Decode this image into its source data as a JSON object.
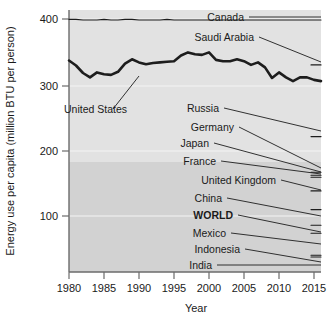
{
  "chart_data": {
    "type": "line",
    "title": "",
    "xlabel": "Year",
    "ylabel": "Energy use per capita (million BTU per person)",
    "xlim": [
      1980,
      2016
    ],
    "ylim": [
      0,
      420
    ],
    "xticks": [
      1980,
      1985,
      1990,
      1995,
      2000,
      2005,
      2010,
      2015
    ],
    "xtick_labels": [
      "1980",
      "1985",
      "1990",
      "1995",
      "2000",
      "2005",
      "2010",
      "2015"
    ],
    "yticks": [
      100,
      200,
      300,
      400
    ],
    "ytick_labels": [
      "100",
      "200",
      "300",
      "400"
    ],
    "grid": true,
    "legend": "inline-labels-right",
    "x": [
      1980,
      1981,
      1982,
      1983,
      1984,
      1985,
      1986,
      1987,
      1988,
      1989,
      1990,
      1991,
      1992,
      1993,
      1994,
      1995,
      1996,
      1997,
      1998,
      1999,
      2000,
      2001,
      2002,
      2003,
      2004,
      2005,
      2006,
      2007,
      2008,
      2009,
      2010,
      2011,
      2012,
      2013,
      2014,
      2015,
      2016
    ],
    "series": [
      {
        "name": "Canada",
        "label": "Canada",
        "bold": false,
        "values": [
          405,
          405,
          404,
          404,
          404,
          405,
          404,
          404,
          405,
          405,
          404,
          404,
          404,
          404,
          405,
          404,
          404,
          404,
          404,
          404,
          404,
          404,
          404,
          404,
          404,
          404,
          404,
          404,
          404,
          404,
          404,
          404,
          404,
          404,
          404,
          404,
          404
        ],
        "end_value": 404
      },
      {
        "name": "Saudi Arabia",
        "label": "Saudi Arabia",
        "bold": false,
        "values": [
          null,
          null,
          null,
          null,
          null,
          null,
          null,
          null,
          null,
          null,
          null,
          null,
          null,
          null,
          null,
          null,
          null,
          null,
          null,
          null,
          null,
          null,
          null,
          null,
          null,
          null,
          null,
          null,
          null,
          null,
          null,
          null,
          null,
          null,
          null,
          null,
          332
        ],
        "end_value": 332
      },
      {
        "name": "United States",
        "label": "United States",
        "bold": false,
        "values": [
          339,
          331,
          319,
          312,
          320,
          317,
          316,
          321,
          334,
          341,
          336,
          333,
          335,
          336,
          337,
          338,
          347,
          352,
          349,
          348,
          352,
          340,
          338,
          338,
          341,
          338,
          332,
          336,
          328,
          311,
          320,
          312,
          306,
          312,
          312,
          308,
          306
        ],
        "end_value": 306
      },
      {
        "name": "Russia",
        "label": "Russia",
        "bold": false,
        "values": [
          null,
          null,
          null,
          null,
          null,
          null,
          null,
          null,
          null,
          null,
          null,
          null,
          null,
          null,
          null,
          null,
          null,
          null,
          null,
          null,
          null,
          null,
          null,
          null,
          null,
          null,
          null,
          null,
          null,
          null,
          null,
          null,
          null,
          null,
          null,
          null,
          217
        ],
        "end_value": 217
      },
      {
        "name": "Germany",
        "label": "Germany",
        "bold": false,
        "values": [
          null,
          null,
          null,
          null,
          null,
          null,
          null,
          null,
          null,
          null,
          null,
          null,
          null,
          null,
          null,
          null,
          null,
          null,
          null,
          null,
          null,
          null,
          null,
          null,
          null,
          null,
          null,
          null,
          null,
          null,
          null,
          null,
          null,
          null,
          null,
          null,
          160
        ],
        "end_value": 160
      },
      {
        "name": "Japan",
        "label": "Japan",
        "bold": false,
        "values": [
          null,
          null,
          null,
          null,
          null,
          null,
          null,
          null,
          null,
          null,
          null,
          null,
          null,
          null,
          null,
          null,
          null,
          null,
          null,
          null,
          null,
          null,
          null,
          null,
          null,
          null,
          null,
          null,
          null,
          null,
          null,
          null,
          null,
          null,
          null,
          null,
          155
        ],
        "end_value": 155
      },
      {
        "name": "France",
        "label": "France",
        "bold": false,
        "values": [
          null,
          null,
          null,
          null,
          null,
          null,
          null,
          null,
          null,
          null,
          null,
          null,
          null,
          null,
          null,
          null,
          null,
          null,
          null,
          null,
          null,
          null,
          null,
          null,
          null,
          null,
          null,
          null,
          null,
          null,
          null,
          null,
          null,
          null,
          null,
          null,
          152
        ],
        "end_value": 152
      },
      {
        "name": "United Kingdom",
        "label": "United Kingdom",
        "bold": false,
        "values": [
          null,
          null,
          null,
          null,
          null,
          null,
          null,
          null,
          null,
          null,
          null,
          null,
          null,
          null,
          null,
          null,
          null,
          null,
          null,
          null,
          null,
          null,
          null,
          null,
          null,
          null,
          null,
          null,
          null,
          null,
          null,
          null,
          null,
          null,
          null,
          null,
          130
        ],
        "end_value": 130
      },
      {
        "name": "China",
        "label": "China",
        "bold": false,
        "values": [
          null,
          null,
          null,
          null,
          null,
          null,
          null,
          null,
          null,
          null,
          null,
          null,
          null,
          null,
          null,
          null,
          null,
          null,
          null,
          null,
          null,
          null,
          null,
          null,
          null,
          null,
          null,
          null,
          null,
          null,
          null,
          null,
          null,
          null,
          null,
          null,
          100
        ],
        "end_value": 100
      },
      {
        "name": "WORLD",
        "label": "WORLD",
        "bold": true,
        "values": [
          null,
          null,
          null,
          null,
          null,
          null,
          null,
          null,
          null,
          null,
          null,
          null,
          null,
          null,
          null,
          null,
          null,
          null,
          null,
          null,
          null,
          null,
          null,
          null,
          null,
          null,
          null,
          null,
          null,
          null,
          null,
          null,
          null,
          null,
          null,
          null,
          75
        ],
        "end_value": 75
      },
      {
        "name": "Mexico",
        "label": "Mexico",
        "bold": false,
        "values": [
          null,
          null,
          null,
          null,
          null,
          null,
          null,
          null,
          null,
          null,
          null,
          null,
          null,
          null,
          null,
          null,
          null,
          null,
          null,
          null,
          null,
          null,
          null,
          null,
          null,
          null,
          null,
          null,
          null,
          null,
          null,
          null,
          null,
          null,
          null,
          null,
          62
        ],
        "end_value": 62
      },
      {
        "name": "Indonesia",
        "label": "Indonesia",
        "bold": false,
        "values": [
          null,
          null,
          null,
          null,
          null,
          null,
          null,
          null,
          null,
          null,
          null,
          null,
          null,
          null,
          null,
          null,
          null,
          null,
          null,
          null,
          null,
          null,
          null,
          null,
          null,
          null,
          null,
          null,
          null,
          null,
          null,
          null,
          null,
          null,
          null,
          null,
          27
        ],
        "end_value": 27
      },
      {
        "name": "India",
        "label": "India",
        "bold": false,
        "values": [
          null,
          null,
          null,
          null,
          null,
          null,
          null,
          null,
          null,
          null,
          null,
          null,
          null,
          null,
          null,
          null,
          null,
          null,
          null,
          null,
          null,
          null,
          null,
          null,
          null,
          null,
          null,
          null,
          null,
          null,
          null,
          null,
          null,
          null,
          null,
          null,
          24
        ],
        "end_value": 24
      }
    ],
    "annotations": [
      {
        "name": "united-states-callout",
        "text": "United States",
        "points_to_year": 1990,
        "points_to_value": 336
      }
    ]
  },
  "axis": {
    "y_title": "Energy use per capita (million BTU per person)",
    "x_title": "Year",
    "y_labels": [
      "400",
      "300",
      "200",
      "100"
    ],
    "x_labels": [
      "1980",
      "1985",
      "1990",
      "1995",
      "2000",
      "2005",
      "2010",
      "2015"
    ]
  },
  "labels": {
    "canada": "Canada",
    "saudi_arabia": "Saudi Arabia",
    "united_states": "United States",
    "russia": "Russia",
    "germany": "Germany",
    "japan": "Japan",
    "france": "France",
    "united_kingdom": "United Kingdom",
    "china": "China",
    "world": "WORLD",
    "mexico": "Mexico",
    "indonesia": "Indonesia",
    "india": "India"
  },
  "colors": {
    "line": "#1d1d1d",
    "plot_bg_upper": "#e2e2e2",
    "plot_bg_lower": "#d2d2d2",
    "gridline": "#f4f4f4",
    "axis": "#6b6b6b",
    "text": "#1a1a1a"
  }
}
